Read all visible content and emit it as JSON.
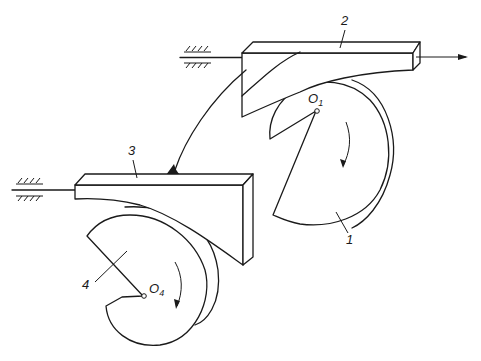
{
  "diagram": {
    "type": "mechanism",
    "colors": {
      "line": "#1a1a1a",
      "background": "#ffffff"
    },
    "labels": {
      "part1": "1",
      "part2": "2",
      "part3": "3",
      "part4": "4",
      "center1_main": "O",
      "center1_sub": "1",
      "center4_main": "O",
      "center4_sub": "4"
    },
    "components": [
      {
        "id": "1",
        "kind": "spiral cam",
        "center": "O1",
        "rotation": "clockwise"
      },
      {
        "id": "2",
        "kind": "slider",
        "guide": "fixed ground (top)",
        "output": "arrow to right"
      },
      {
        "id": "3",
        "kind": "slider",
        "guide": "fixed ground (left)"
      },
      {
        "id": "4",
        "kind": "spiral cam",
        "center": "O4",
        "rotation": "clockwise"
      }
    ],
    "connections": [
      {
        "from": "2",
        "to": "3",
        "kind": "curved rigid link"
      }
    ]
  }
}
